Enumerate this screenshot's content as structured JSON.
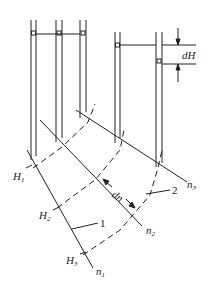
{
  "diagram": {
    "title": "",
    "labels": {
      "dH": "dH",
      "dn": "dn",
      "H1": "H",
      "H1_sub": "1",
      "H2": "H",
      "H2_sub": "2",
      "H3": "H",
      "H3_sub": "3",
      "n1": "n",
      "n1_sub": "1",
      "n2": "n",
      "n2_sub": "2",
      "n3": "n",
      "n3_sub": "3",
      "callout1": "1",
      "callout2": "2"
    },
    "piezometers": [
      {
        "x": 33,
        "water_level_y": 33
      },
      {
        "x": 59,
        "water_level_y": 33
      },
      {
        "x": 83,
        "water_level_y": 33
      },
      {
        "x": 117,
        "water_level_y": 45
      },
      {
        "x": 159,
        "water_level_y": 61
      }
    ],
    "colors": {
      "stroke": "#222222",
      "background": "#ffffff"
    }
  }
}
